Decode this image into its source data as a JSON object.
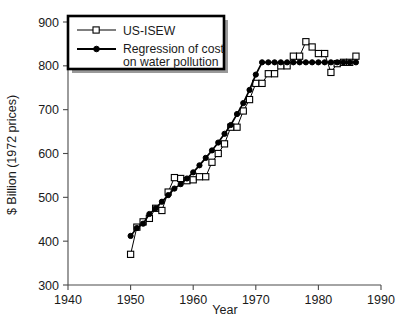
{
  "chart_data": {
    "type": "line",
    "title": "",
    "xlabel": "Year",
    "ylabel": "$ Billion (1972 prices)",
    "xlim": [
      1940,
      1990
    ],
    "ylim": [
      300,
      900
    ],
    "xticks": [
      1940,
      1950,
      1960,
      1970,
      1980,
      1990
    ],
    "yticks": [
      300,
      400,
      500,
      600,
      700,
      800,
      900
    ],
    "grid": false,
    "legend_position": "upper-left",
    "series": [
      {
        "name": "US-ISEW",
        "marker": "open-square",
        "x": [
          1950,
          1951,
          1952,
          1953,
          1954,
          1955,
          1956,
          1957,
          1958,
          1959,
          1960,
          1961,
          1962,
          1963,
          1964,
          1965,
          1966,
          1967,
          1968,
          1969,
          1970,
          1971,
          1972,
          1973,
          1974,
          1975,
          1976,
          1977,
          1978,
          1979,
          1980,
          1981,
          1982,
          1983,
          1984,
          1985,
          1986
        ],
        "values": [
          370,
          432,
          444,
          452,
          475,
          470,
          512,
          545,
          543,
          538,
          540,
          547,
          547,
          580,
          600,
          622,
          660,
          660,
          697,
          723,
          760,
          760,
          782,
          782,
          800,
          800,
          822,
          822,
          855,
          843,
          828,
          828,
          785,
          805,
          808,
          808,
          822
        ]
      },
      {
        "name": "Regression of cost on water pollution",
        "marker": "filled-circle",
        "x": [
          1950,
          1951,
          1952,
          1953,
          1954,
          1955,
          1956,
          1957,
          1958,
          1959,
          1960,
          1961,
          1962,
          1963,
          1964,
          1965,
          1966,
          1967,
          1968,
          1969,
          1970,
          1971,
          1972,
          1973,
          1974,
          1975,
          1976,
          1977,
          1978,
          1979,
          1980,
          1981,
          1982,
          1983,
          1984,
          1985,
          1986
        ],
        "values": [
          412,
          430,
          440,
          462,
          475,
          490,
          505,
          520,
          530,
          543,
          557,
          573,
          590,
          607,
          625,
          645,
          665,
          690,
          715,
          745,
          780,
          808,
          808,
          808,
          808,
          808,
          808,
          808,
          808,
          808,
          808,
          808,
          808,
          808,
          808,
          808,
          808
        ]
      }
    ],
    "annotations": []
  },
  "legend": {
    "entries": [
      {
        "label": "US-ISEW",
        "marker": "open-square"
      },
      {
        "label": "Regression of cost",
        "label_line2": "on water pollution",
        "marker": "filled-circle"
      }
    ]
  },
  "axes": {
    "x_title": "Year",
    "y_title": "$ Billion (1972 prices)",
    "x_tick_labels": [
      "1940",
      "1950",
      "1960",
      "1970",
      "1980",
      "1990"
    ],
    "y_tick_labels": [
      "300",
      "400",
      "500",
      "600",
      "700",
      "800",
      "900"
    ]
  },
  "colors": {
    "series_line": "#000000",
    "axis": "#4a4a4a",
    "text": "#1a1a1a",
    "legend_shadow": "#9a9a9a",
    "background": "#ffffff"
  }
}
